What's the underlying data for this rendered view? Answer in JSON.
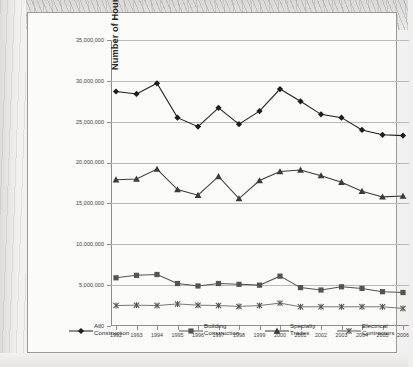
{
  "figure": {
    "frame_border_color": "#9a9a98",
    "plot_background": "#fbfbfa"
  },
  "axis": {
    "y_title": "Number of Hours Missed from Injuries and Illnesses",
    "y_ticks": [
      "35,000,000",
      "30,000,000",
      "25,000,000",
      "20,000,000",
      "15,000,000",
      "10,000,000",
      "5,000,000",
      "0"
    ]
  },
  "legend": {
    "items": [
      {
        "label": "All\nConstruction",
        "marker": "diamond-marker",
        "color": "#1d1d1b"
      },
      {
        "label": "Building\nConstruction",
        "marker": "square-marker",
        "color": "#54544f"
      },
      {
        "label": "Specialty\nTrades",
        "marker": "triangle-marker",
        "color": "#3a3a36"
      },
      {
        "label": "Electrical\nContractors",
        "marker": "x-marker",
        "color": "#55554f"
      }
    ]
  },
  "chart_data": {
    "type": "line",
    "title": "",
    "xlabel": "",
    "ylabel": "Number of Hours Missed from Injuries and Illnesses",
    "ylim": [
      0,
      35000000
    ],
    "ytick_step": 5000000,
    "grid": true,
    "legend_position": "bottom",
    "categories": [
      "1992",
      "1993",
      "1994",
      "1995",
      "1996",
      "1997",
      "1998",
      "1999",
      "2000",
      "2001",
      "2002",
      "2003",
      "2004",
      "2005",
      "2006"
    ],
    "series": [
      {
        "name": "All Construction",
        "marker": "diamond",
        "color": "#1d1d1b",
        "values": [
          28700000,
          28400000,
          29700000,
          25500000,
          24400000,
          26700000,
          24700000,
          26300000,
          29000000,
          27500000,
          25900000,
          25500000,
          24000000,
          23400000,
          23300000
        ]
      },
      {
        "name": "Building Construction",
        "marker": "square",
        "color": "#54544f",
        "values": [
          5900000,
          6200000,
          6300000,
          5200000,
          4900000,
          5200000,
          5100000,
          5000000,
          6100000,
          4700000,
          4400000,
          4800000,
          4600000,
          4200000,
          4100000
        ]
      },
      {
        "name": "Specialty Trades",
        "marker": "triangle",
        "color": "#3a3a36",
        "values": [
          17900000,
          18000000,
          19200000,
          16700000,
          16000000,
          18300000,
          15600000,
          17800000,
          18900000,
          19100000,
          18400000,
          17600000,
          16500000,
          15800000,
          15900000
        ]
      },
      {
        "name": "Electrical Contractors",
        "marker": "x",
        "color": "#55554f",
        "values": [
          2500000,
          2550000,
          2500000,
          2700000,
          2550000,
          2500000,
          2400000,
          2500000,
          2800000,
          2350000,
          2350000,
          2350000,
          2350000,
          2350000,
          2150000
        ]
      }
    ]
  }
}
